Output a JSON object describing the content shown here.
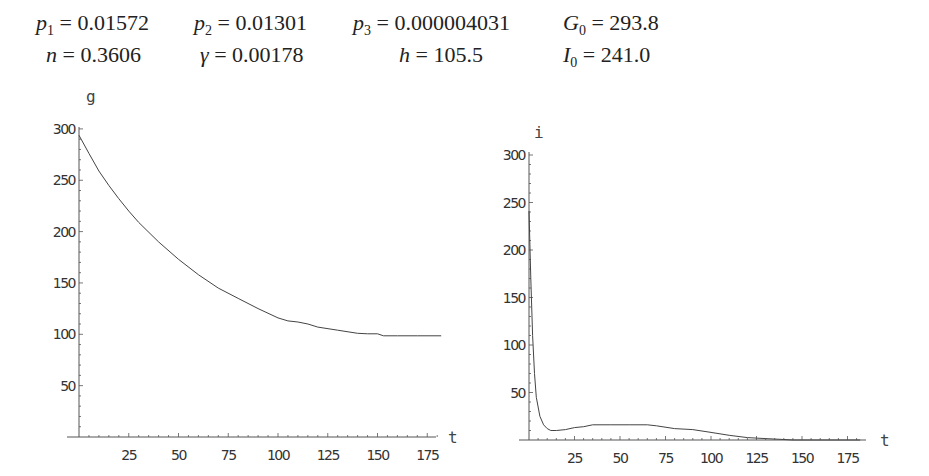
{
  "parameters": {
    "row1": [
      {
        "symbol": "p",
        "sub": "1",
        "value": "0.01572"
      },
      {
        "symbol": "p",
        "sub": "2",
        "value": "0.01301"
      },
      {
        "symbol": "p",
        "sub": "3",
        "value": "0.000004031"
      },
      {
        "symbol": "G",
        "sub": "0",
        "value": "293.8"
      }
    ],
    "row2": [
      {
        "symbol": "n",
        "sub": "",
        "value": "0.3606"
      },
      {
        "symbol": "γ",
        "sub": "",
        "value": "0.00178"
      },
      {
        "symbol": "h",
        "sub": "",
        "value": "105.5"
      },
      {
        "symbol": "I",
        "sub": "0",
        "value": "241.0"
      }
    ]
  },
  "chart_data": [
    {
      "type": "line",
      "title": "",
      "xlabel": "t",
      "ylabel": "g",
      "xlim": [
        0,
        182
      ],
      "ylim": [
        0,
        300
      ],
      "xticks": [
        25,
        50,
        75,
        100,
        125,
        150,
        175
      ],
      "yticks": [
        50,
        100,
        150,
        200,
        250,
        300
      ],
      "grid": false,
      "series": [
        {
          "name": "g",
          "x": [
            0,
            5,
            10,
            15,
            20,
            25,
            30,
            40,
            50,
            60,
            70,
            80,
            90,
            100,
            105,
            110,
            115,
            120,
            130,
            140,
            145,
            150,
            153,
            160,
            170,
            182
          ],
          "values": [
            293.8,
            276,
            259,
            245,
            232,
            220,
            209,
            190,
            173,
            158,
            145,
            135,
            125,
            116,
            113,
            112,
            110,
            107,
            104,
            101,
            100.5,
            100.5,
            98.5,
            98.5,
            98.5,
            98.5
          ]
        }
      ]
    },
    {
      "type": "line",
      "title": "",
      "xlabel": "t",
      "ylabel": "i",
      "xlim": [
        0,
        182
      ],
      "ylim": [
        0,
        300
      ],
      "xticks": [
        25,
        50,
        75,
        100,
        125,
        150,
        175
      ],
      "yticks": [
        50,
        100,
        150,
        200,
        250,
        300
      ],
      "grid": false,
      "series": [
        {
          "name": "i",
          "x": [
            0,
            1,
            2,
            3,
            4,
            6,
            8,
            10,
            12,
            15,
            20,
            25,
            30,
            35,
            45,
            55,
            65,
            70,
            80,
            90,
            100,
            110,
            120,
            130,
            140,
            145,
            150,
            182
          ],
          "values": [
            241,
            170,
            110,
            70,
            45,
            25,
            16,
            12,
            10,
            10,
            11,
            13,
            14,
            16,
            16,
            16,
            16,
            15,
            12,
            11,
            8,
            5,
            2.5,
            1.5,
            0.5,
            0,
            0,
            0
          ]
        }
      ]
    }
  ]
}
